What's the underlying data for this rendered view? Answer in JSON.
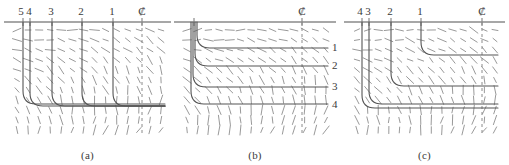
{
  "figure": {
    "panels": [
      {
        "caption": "(a)",
        "centerline_symbol": "₡",
        "top_labels": [
          {
            "text": "5",
            "x": 21
          },
          {
            "text": "4",
            "x": 29
          },
          {
            "text": "3",
            "x": 51
          },
          {
            "text": "2",
            "x": 81
          },
          {
            "text": "1",
            "x": 112
          }
        ],
        "centerline_label_x": 140,
        "right_labels": [],
        "tick_x": [
          23,
          30,
          52,
          82,
          113
        ],
        "contours": [
          {
            "name": "5",
            "x": 23,
            "y_turn": 104,
            "x_end": 170
          },
          {
            "name": "4",
            "x": 30,
            "y_turn": 106,
            "x_end": 170
          },
          {
            "name": "3",
            "x": 52,
            "y_turn": 106,
            "x_end": 170
          },
          {
            "name": "2",
            "x": 82,
            "y_turn": 106,
            "x_end": 170
          },
          {
            "name": "1",
            "x": 113,
            "y_turn": 106,
            "x_end": 170
          }
        ],
        "wall_y": 22,
        "field_rows": 11,
        "field_cols": 14
      },
      {
        "caption": "(b)",
        "centerline_symbol": "₡",
        "top_labels": [],
        "centerline_label_x": 130,
        "right_labels": [
          {
            "text": "1",
            "y": 47
          },
          {
            "text": "2",
            "y": 65
          },
          {
            "text": "3",
            "y": 86
          },
          {
            "text": "4",
            "y": 104
          }
        ],
        "tick_x": [
          24
        ],
        "contours": [
          {
            "name": "1",
            "x": 27,
            "y_turn": 48,
            "x_end": 158
          },
          {
            "name": "2",
            "x": 25,
            "y_turn": 66,
            "x_end": 158
          },
          {
            "name": "3",
            "x": 23,
            "y_turn": 87,
            "x_end": 158
          },
          {
            "name": "4",
            "x": 21,
            "y_turn": 104,
            "x_end": 158
          }
        ],
        "wall_y": 22,
        "field_rows": 11,
        "field_cols": 14
      },
      {
        "caption": "(c)",
        "centerline_symbol": "₡",
        "top_labels": [
          {
            "text": "4",
            "x": 20
          },
          {
            "text": "3",
            "x": 28
          },
          {
            "text": "2",
            "x": 50
          },
          {
            "text": "1",
            "x": 80
          }
        ],
        "centerline_label_x": 140,
        "right_labels": [],
        "tick_x": [
          22,
          29,
          51,
          81
        ],
        "contours": [
          {
            "name": "1",
            "x": 81,
            "y_turn": 55,
            "x_end": 158
          },
          {
            "name": "2",
            "x": 51,
            "y_turn": 86,
            "x_end": 158
          },
          {
            "name": "3",
            "x": 29,
            "y_turn": 104,
            "x_end": 158
          },
          {
            "name": "4",
            "x": 22,
            "y_turn": 108,
            "x_end": 158
          }
        ],
        "wall_y": 22,
        "field_rows": 11,
        "field_cols": 14
      }
    ]
  },
  "style": {
    "line_color": "#8a8a8a",
    "curve_color": "#555555",
    "vector_color": "#8d8d8d",
    "text_color": "#3a3a3a"
  }
}
